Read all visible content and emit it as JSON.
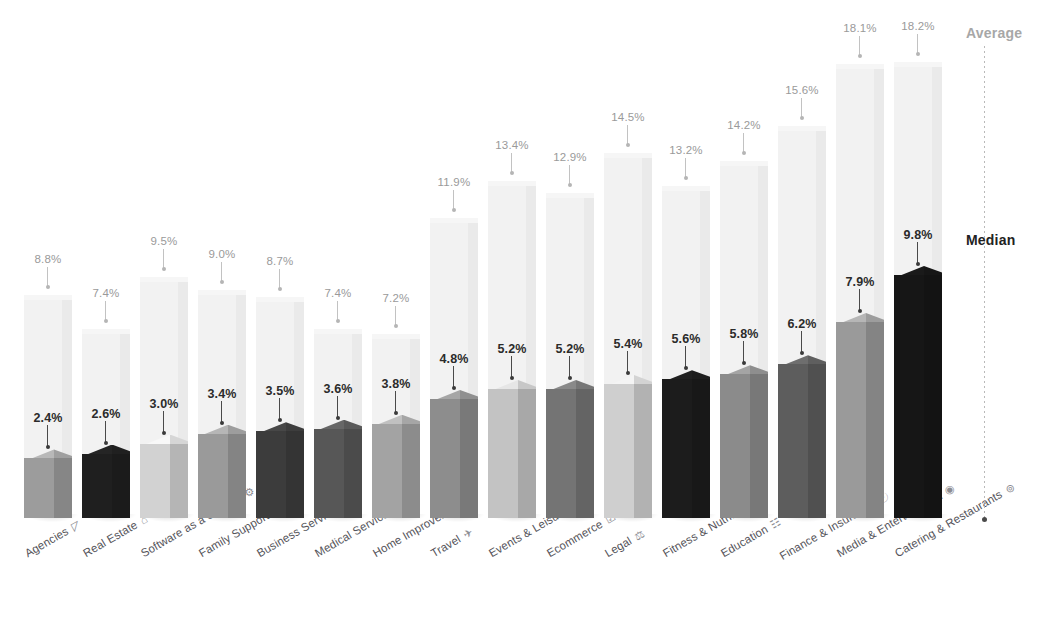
{
  "legend": {
    "average_label": "Average",
    "median_label": "Median",
    "average_color": "#a7a7a7",
    "median_color": "#222222"
  },
  "chart_data": {
    "type": "bar",
    "title": "",
    "subtitle": "",
    "xlabel": "",
    "ylabel": "",
    "grid": false,
    "legend_position": "right",
    "ylim": [
      0,
      20
    ],
    "value_suffix": "%",
    "categories": [
      "Agencies",
      "Real Estate",
      "Software as a Service",
      "Family Support",
      "Business Services",
      "Medical Services",
      "Home Improvement",
      "Travel",
      "Events & Leisure",
      "Ecommerce",
      "Legal",
      "Fitness & Nutrition",
      "Education",
      "Finance & Insurance",
      "Media & Entertainment",
      "Catering & Restaurants"
    ],
    "category_icons": [
      "megaphone-icon",
      "house-icon",
      "gear-icon",
      "binoculars-icon",
      "briefcase-icon",
      "stethoscope-icon",
      "paintroller-icon",
      "airplane-icon",
      "ticket-icon",
      "cart-icon",
      "scales-icon",
      "dumbbell-icon",
      "book-icon",
      "bank-icon",
      "play-icon",
      "cutlery-icon"
    ],
    "series": [
      {
        "name": "Average",
        "values": [
          8.8,
          7.4,
          9.5,
          9.0,
          8.7,
          7.4,
          7.2,
          11.9,
          13.4,
          12.9,
          14.5,
          13.2,
          14.2,
          15.6,
          18.1,
          18.2
        ],
        "labels": [
          "8.8%",
          "7.4%",
          "9.5%",
          "9.0%",
          "8.7%",
          "7.4%",
          "7.2%",
          "11.9%",
          "13.4%",
          "12.9%",
          "14.5%",
          "13.2%",
          "14.2%",
          "15.6%",
          "18.1%",
          "18.2%"
        ]
      },
      {
        "name": "Median",
        "values": [
          2.4,
          2.6,
          3.0,
          3.4,
          3.5,
          3.6,
          3.8,
          4.8,
          5.2,
          5.2,
          5.4,
          5.6,
          5.8,
          6.2,
          7.9,
          9.8
        ],
        "labels": [
          "2.4%",
          "2.6%",
          "3.0%",
          "3.4%",
          "3.5%",
          "3.6%",
          "3.8%",
          "4.8%",
          "5.2%",
          "5.2%",
          "5.4%",
          "5.6%",
          "5.8%",
          "6.2%",
          "7.9%",
          "9.8%"
        ],
        "colors": [
          "#9c9c9c",
          "#1f1f1f",
          "#d2d2d2",
          "#9a9a9a",
          "#3c3c3c",
          "#575757",
          "#a3a3a3",
          "#8d8d8d",
          "#c3c3c3",
          "#747474",
          "#cfcfcf",
          "#1c1c1c",
          "#8b8b8b",
          "#5d5d5d",
          "#9a9a9a",
          "#161616"
        ]
      }
    ]
  }
}
